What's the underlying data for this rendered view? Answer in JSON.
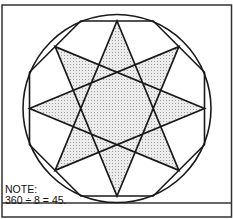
{
  "diagram": {
    "colors": {
      "stroke": "#1a1a1a",
      "fill_pattern": "#e4e4e4",
      "fill_dot": "#9a9a9a",
      "background": "#ffffff"
    },
    "circle": {
      "cx": 117,
      "cy": 108.5,
      "r": 94
    },
    "octagon": {
      "apothem": 87.5
    },
    "star": {
      "points": 8,
      "step": 3
    }
  },
  "note": {
    "line1": "NOTE:",
    "line2": "360 ÷ 8 = 45."
  }
}
